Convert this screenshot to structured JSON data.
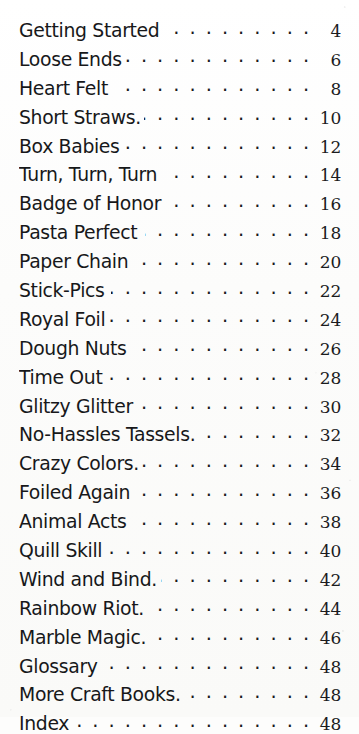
{
  "page": {
    "kind": "table-of-contents",
    "leader_char": ".",
    "text_color": "#17181a",
    "background_color": "#fdfdfc"
  },
  "entries": [
    {
      "title": "Getting Started",
      "page": "4",
      "tight": true
    },
    {
      "title": "Loose Ends",
      "page": "6",
      "tight": true
    },
    {
      "title": "Heart Felt",
      "page": "8",
      "tight": false
    },
    {
      "title": "Short Straws.",
      "page": "10",
      "tight": true
    },
    {
      "title": "Box Babies",
      "page": "12",
      "tight": false
    },
    {
      "title": "Turn, Turn, Turn",
      "page": "14",
      "tight": false
    },
    {
      "title": "Badge of Honor",
      "page": "16",
      "tight": false
    },
    {
      "title": "Pasta Perfect",
      "page": "18",
      "tight": false
    },
    {
      "title": "Paper Chain",
      "page": "20",
      "tight": true
    },
    {
      "title": "Stick-Pics",
      "page": "22",
      "tight": false
    },
    {
      "title": "Royal Foil",
      "page": "24",
      "tight": true
    },
    {
      "title": "Dough Nuts",
      "page": "26",
      "tight": false
    },
    {
      "title": "Time Out",
      "page": "28",
      "tight": false
    },
    {
      "title": "Glitzy Glitter",
      "page": "30",
      "tight": true
    },
    {
      "title": "No-Hassles Tassels.",
      "page": "32",
      "tight": true
    },
    {
      "title": "Crazy Colors.",
      "page": "34",
      "tight": true
    },
    {
      "title": "Foiled Again",
      "page": "36",
      "tight": true
    },
    {
      "title": "Animal Acts",
      "page": "38",
      "tight": false
    },
    {
      "title": "Quill Skill",
      "page": "40",
      "tight": false
    },
    {
      "title": "Wind and Bind.",
      "page": "42",
      "tight": true
    },
    {
      "title": "Rainbow Riot.",
      "page": "44",
      "tight": true
    },
    {
      "title": "Marble Magic.",
      "page": "46",
      "tight": true
    },
    {
      "title": "Glossary",
      "page": "48",
      "tight": false
    },
    {
      "title": "More Craft Books.",
      "page": "48",
      "tight": true
    },
    {
      "title": "Index",
      "page": "48",
      "tight": false
    }
  ]
}
